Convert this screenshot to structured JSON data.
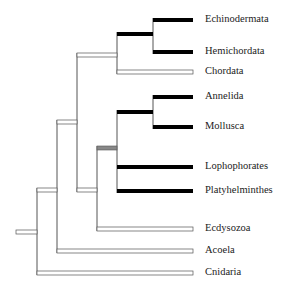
{
  "chart_data": {
    "type": "tree",
    "title": "",
    "style": {
      "solid_color": "#000000",
      "open_stroke": "#555555",
      "grey_fill": "#888888"
    },
    "taxa": [
      {
        "name": "Echinodermata",
        "y": 20,
        "branch_style": "solid"
      },
      {
        "name": "Hemichordata",
        "y": 52,
        "branch_style": "solid"
      },
      {
        "name": "Chordata",
        "y": 72,
        "branch_style": "open"
      },
      {
        "name": "Annelida",
        "y": 97,
        "branch_style": "solid"
      },
      {
        "name": "Mollusca",
        "y": 127,
        "branch_style": "solid"
      },
      {
        "name": "Lophophorates",
        "y": 167,
        "branch_style": "solid"
      },
      {
        "name": "Platyhelminthes",
        "y": 191,
        "branch_style": "solid"
      },
      {
        "name": "Ecdysozoa",
        "y": 229,
        "branch_style": "open"
      },
      {
        "name": "Acoela",
        "y": 251,
        "branch_style": "open"
      },
      {
        "name": "Cnidaria",
        "y": 273,
        "branch_style": "open"
      }
    ],
    "newick": "((((((Echinodermata,Hemichordata),Chordata),((((Annelida,Mollusca),Lophophorates,Platyhelminthes),Ecdysozoa))),Acoela),Cnidaria);",
    "internal_nodes": [
      {
        "id": "echino_hemi",
        "x": 153,
        "y_top": 20,
        "y_bottom": 52,
        "stem_y": 34,
        "stem_to_x": 117,
        "stem_style": "solid"
      },
      {
        "id": "deuterostomes",
        "x": 117,
        "y_top": 34,
        "y_bottom": 72,
        "stem_y": 55,
        "stem_to_x": 77,
        "stem_style": "open"
      },
      {
        "id": "annelid_mollusc",
        "x": 153,
        "y_top": 97,
        "y_bottom": 127,
        "stem_y": 112,
        "stem_to_x": 117,
        "stem_style": "solid"
      },
      {
        "id": "lophotrochozoa",
        "x": 117,
        "y_top": 112,
        "y_bottom": 191,
        "stem_y": 148,
        "stem_to_x": 97,
        "stem_style": "grey"
      },
      {
        "id": "protostomes",
        "x": 97,
        "y_top": 148,
        "y_bottom": 229,
        "stem_y": 190,
        "stem_to_x": 77,
        "stem_style": "open"
      },
      {
        "id": "bilateria_core",
        "x": 77,
        "y_top": 55,
        "y_bottom": 190,
        "stem_y": 122,
        "stem_to_x": 57,
        "stem_style": "open"
      },
      {
        "id": "bilateria",
        "x": 57,
        "y_top": 122,
        "y_bottom": 251,
        "stem_y": 190,
        "stem_to_x": 37,
        "stem_style": "open"
      },
      {
        "id": "root",
        "x": 37,
        "y_top": 190,
        "y_bottom": 273,
        "stem_y": 232,
        "stem_to_x": 16,
        "stem_style": "open"
      }
    ],
    "tip_x": 193,
    "legend": "none"
  }
}
